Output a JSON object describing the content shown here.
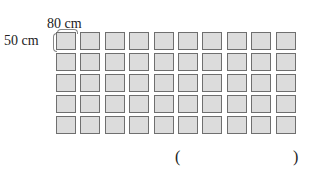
{
  "diagram": {
    "width_label": "80 cm",
    "height_label": "50 cm",
    "grid": {
      "columns": 10,
      "rows": 5,
      "tile_fill": "#dcdcdc",
      "tile_border": "#6f6f6f"
    },
    "answer": {
      "open": "(",
      "close": ")"
    }
  }
}
